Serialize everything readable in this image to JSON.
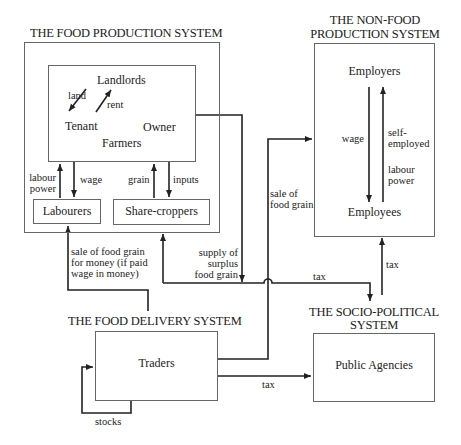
{
  "diagram": {
    "food_production": {
      "title": "THE FOOD PRODUCTION SYSTEM",
      "farmers_box": {
        "landlords": "Landlords",
        "land": "land",
        "rent": "rent",
        "tenant": "Tenant",
        "owner": "Owner",
        "farmers": "Farmers"
      },
      "labourers": "Labourers",
      "share_croppers": "Share-croppers",
      "labour_power": [
        "labour",
        "power"
      ],
      "wage": "wage",
      "grain": "grain",
      "inputs": "inputs"
    },
    "non_food_production": {
      "title": [
        "THE NON-FOOD",
        "PRODUCTION SYSTEM"
      ],
      "employers": "Employers",
      "employees": "Employees",
      "wage": "wage",
      "self_employed": [
        "self-",
        "employed"
      ],
      "labour_power": [
        "labour",
        "power"
      ]
    },
    "food_delivery": {
      "title": "THE FOOD DELIVERY SYSTEM",
      "traders": "Traders",
      "stocks": "stocks"
    },
    "socio_political": {
      "title": [
        "THE SOCIO-POLITICAL",
        "SYSTEM"
      ],
      "public_agencies": "Public Agencies"
    },
    "flows": {
      "sale_for_money": [
        "sale of food grain",
        "for money (if paid",
        "wage in money)"
      ],
      "supply_surplus": [
        "supply of",
        "surplus",
        "food grain"
      ],
      "sale_of_food_grain": [
        "sale of",
        "food grain"
      ],
      "tax_to_socio": "tax",
      "tax_to_nonfood": "tax",
      "tax_traders": "tax"
    }
  }
}
